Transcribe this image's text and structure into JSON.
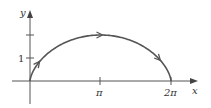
{
  "diagram": {
    "curve": {
      "name": "cycloid",
      "x_eq": "t - sin t",
      "y_eq": "1 - cos t",
      "t_range": [
        0,
        6.2832
      ],
      "direction_arrows": 3
    },
    "axes": {
      "x_label": "x",
      "y_label": "y",
      "x_ticks": [
        {
          "value": 3.14159,
          "label": "π"
        },
        {
          "value": 6.28318,
          "label": "2π"
        }
      ],
      "y_ticks": [
        {
          "value": 1,
          "label": "1"
        },
        {
          "value": 2,
          "label": ""
        }
      ]
    },
    "colors": {
      "curve": "#555555",
      "axis": "#444444",
      "text": "#333333"
    }
  }
}
